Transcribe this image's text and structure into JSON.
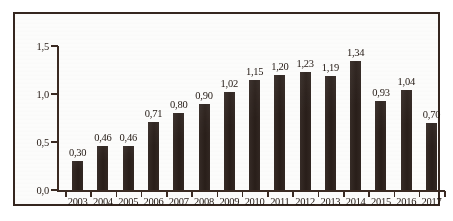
{
  "chart_data": {
    "type": "bar",
    "title": "",
    "subtitle": "",
    "xlabel": "",
    "ylabel": "",
    "categories": [
      "2003",
      "2004",
      "2005",
      "2006",
      "2007",
      "2008",
      "2009",
      "2010",
      "2011",
      "2012",
      "2013",
      "2014",
      "2015",
      "2016",
      "2017"
    ],
    "values": [
      0.3,
      0.46,
      0.46,
      0.71,
      0.8,
      0.9,
      1.02,
      1.15,
      1.2,
      1.23,
      1.19,
      1.34,
      0.93,
      1.04,
      0.7
    ],
    "value_labels": [
      "0,30",
      "0,46",
      "0,46",
      "0,71",
      "0,80",
      "0,90",
      "1,02",
      "1,15",
      "1,20",
      "1,23",
      "1,19",
      "1,34",
      "0,93",
      "1,04",
      "0,70"
    ],
    "ylim": [
      0.0,
      1.5
    ],
    "y_ticks": [
      0.0,
      0.5,
      1.0,
      1.5
    ],
    "y_tick_labels": [
      "0,0",
      "0,5",
      "1,0",
      "1,5"
    ],
    "grid": false,
    "legend": null,
    "legend_position": "none",
    "decimal_separator": ",",
    "series": [
      {
        "name": "",
        "values": [
          0.3,
          0.46,
          0.46,
          0.71,
          0.8,
          0.9,
          1.02,
          1.15,
          1.2,
          1.23,
          1.19,
          1.34,
          0.93,
          1.04,
          0.7
        ]
      }
    ],
    "colors": {
      "bar": "#2b201b",
      "axis": "#3a2a22",
      "text": "#221812",
      "background": "#fcfcfb",
      "frame": "#35261f"
    }
  }
}
